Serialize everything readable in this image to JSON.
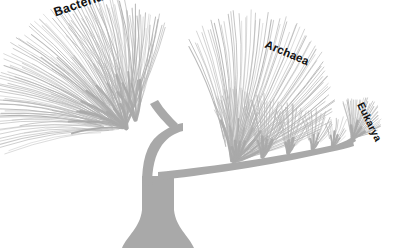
{
  "figure": {
    "kind": "phylogenetic-tree",
    "background_color": "#ffffff",
    "branch_color": "#a9a9a9",
    "twig_color": "#b4b4b4",
    "label_color": "#101010",
    "width": 399,
    "height": 248
  },
  "labels": {
    "bacteria": "Bacteria",
    "archaea": "Archaea",
    "eukarya": "Eukarya"
  },
  "chart_data": {
    "type": "tree",
    "domains": [
      {
        "name": "Bacteria",
        "node": [
          125,
          128
        ],
        "tip_count": 86,
        "fan_start_deg": 168,
        "fan_end_deg": 292,
        "radius": [
          96,
          138
        ]
      },
      {
        "name": "Archaea",
        "node": [
          232,
          163
        ],
        "tip_count": 70,
        "fan_start_deg": 250,
        "fan_end_deg": 340,
        "radius": [
          70,
          150
        ]
      },
      {
        "name": "Eukarya",
        "node": [
          352,
          139
        ],
        "tip_count": 34,
        "fan_start_deg": 255,
        "fan_end_deg": 340,
        "radius": [
          22,
          42
        ]
      }
    ],
    "root": {
      "x": 150,
      "y": 248,
      "trunk_top": [
        155,
        175
      ],
      "flare_halfwidth": 28
    },
    "trunk_fork": [
      157,
      172
    ]
  }
}
